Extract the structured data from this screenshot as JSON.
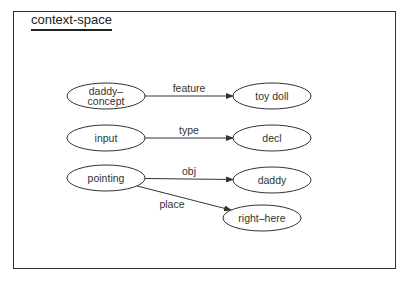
{
  "title": "context-space",
  "nodes": [
    {
      "id": "daddy-concept",
      "lines": [
        "daddy–",
        "concept"
      ],
      "cx": 106,
      "cy": 96
    },
    {
      "id": "toy-doll",
      "lines": [
        "toy  doll"
      ],
      "cx": 272,
      "cy": 96
    },
    {
      "id": "input",
      "lines": [
        "input"
      ],
      "cx": 106,
      "cy": 138
    },
    {
      "id": "decl",
      "lines": [
        "decl"
      ],
      "cx": 272,
      "cy": 138
    },
    {
      "id": "pointing",
      "lines": [
        "pointing"
      ],
      "cx": 106,
      "cy": 178
    },
    {
      "id": "daddy",
      "lines": [
        "daddy"
      ],
      "cx": 272,
      "cy": 180
    },
    {
      "id": "right-here",
      "lines": [
        "right–here"
      ],
      "cx": 262,
      "cy": 218
    }
  ],
  "edges": [
    {
      "from": "daddy-concept",
      "to": "toy-doll",
      "label": "feature"
    },
    {
      "from": "input",
      "to": "decl",
      "label": "type"
    },
    {
      "from": "pointing",
      "to": "daddy",
      "label": "obj"
    },
    {
      "from": "pointing",
      "to": "right-here",
      "label": "place"
    }
  ]
}
